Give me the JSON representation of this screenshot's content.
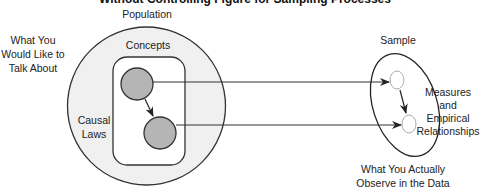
{
  "diagram": {
    "title_clipped": "Without Controlling Figure for Sampling Processes",
    "population": {
      "label": "Population",
      "side_label_lines": [
        "What You",
        "Would Like to",
        "Talk About"
      ],
      "concepts_label": "Concepts",
      "causal_laws_lines": [
        "Causal",
        "Laws"
      ]
    },
    "sample": {
      "label": "Sample",
      "inner_label_lines": [
        "Measures",
        "and",
        "Empirical",
        "Relationships"
      ],
      "bottom_label_lines": [
        "What You Actually",
        "Observe in the Data"
      ]
    },
    "colors": {
      "stroke": "#333333",
      "population_fill": "#f0f0f0",
      "concepts_fill": "#ffffff",
      "concept_node_fill": "#b5b5b5",
      "sample_fill": "#ffffff",
      "text": "#222222"
    }
  }
}
